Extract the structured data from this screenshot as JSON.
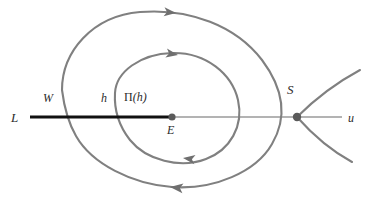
{
  "figure": {
    "width": 373,
    "height": 201,
    "background_color": "#ffffff",
    "curve_color": "#808080",
    "axis_color": "#999999",
    "segment_color": "#000000",
    "label_color": "#2b2b2b"
  },
  "labels": {
    "L": "L",
    "W": "W",
    "h": "h",
    "Pi_h": "Π(h)",
    "Pi_symbol": "Π",
    "Pi_arg": "(h)",
    "E": "E",
    "S": "S",
    "u": "u"
  },
  "points": [
    {
      "name": "E",
      "label": "E",
      "x": 172,
      "y": 117,
      "kind": "center-equilibrium"
    },
    {
      "name": "S",
      "label": "S",
      "x": 297,
      "y": 117,
      "kind": "saddle-equilibrium"
    }
  ],
  "axis": {
    "name": "u-axis",
    "label": "u",
    "x1": 30,
    "x2": 342,
    "y": 117
  },
  "segment": {
    "name": "L-transversal",
    "label": "L",
    "x1": 30,
    "x2": 172,
    "y": 117,
    "thickness": 3
  },
  "marks_on_segment": [
    {
      "label": "W",
      "x": 62
    },
    {
      "label": "h",
      "x": 115
    },
    {
      "label": "Π(h)",
      "x": 143
    }
  ],
  "curves": [
    {
      "name": "outer-trajectory",
      "description": "outer spiral loop from W crossing the transversal, looping clockwise around E toward the saddle S",
      "arrow_direction": "rightward-at-top, leftward-at-bottom"
    },
    {
      "name": "inner-trajectory",
      "description": "inner spiral loop from h around E returning to Pi(h)",
      "arrow_direction": "rightward-at-top, leftward-at-bottom"
    },
    {
      "name": "saddle-separatrix-upper-right",
      "description": "unstable branch leaving S toward upper right"
    },
    {
      "name": "saddle-separatrix-lower-right",
      "description": "stable branch entering S from lower right"
    }
  ],
  "arrowheads": [
    {
      "name": "arrow-outer-top",
      "x": 168,
      "y": 14,
      "angle": 10
    },
    {
      "name": "arrow-inner-top",
      "x": 168,
      "y": 56,
      "angle": 12
    },
    {
      "name": "arrow-inner-bottom",
      "x": 192,
      "y": 157,
      "angle": 190
    },
    {
      "name": "arrow-outer-bottom",
      "x": 178,
      "y": 186,
      "angle": 188
    }
  ]
}
